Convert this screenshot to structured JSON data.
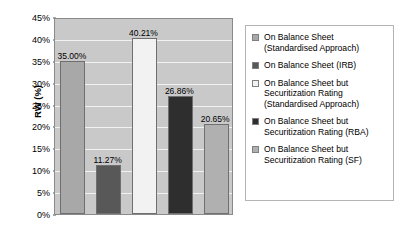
{
  "chart_data": {
    "type": "bar",
    "title": "",
    "xlabel": "",
    "ylabel": "RW (%)",
    "ylim": [
      0,
      45
    ],
    "ytick_labels": [
      "45%",
      "40%",
      "35%",
      "30%",
      "25%",
      "20%",
      "15%",
      "10%",
      "5%",
      "0%"
    ],
    "ytick_values": [
      45,
      40,
      35,
      30,
      25,
      20,
      15,
      10,
      5,
      0
    ],
    "grid": true,
    "legend_position": "right",
    "categories": [
      "On Balance Sheet (Standardised Approach)",
      "On Balance Sheet (IRB)",
      "On Balance Sheet but Securitization Rating (Standardised Approach)",
      "On Balance Sheet but Securitization Rating (RBA)",
      "On Balance Sheet but Securitization Rating (SF)"
    ],
    "values": [
      35.0,
      11.27,
      40.21,
      26.86,
      20.65
    ],
    "data_labels": [
      "35.00%",
      "11.27%",
      "40.21%",
      "26.86%",
      "20.65%"
    ],
    "bar_colors": [
      "#a8a8a8",
      "#585858",
      "#f2f2f2",
      "#2e2e2e",
      "#b0b0b0"
    ],
    "plot_background": "#c9c9c9",
    "gridline_color": "#f2f2f2",
    "axis_color": "#8a8a8a"
  },
  "legend": {
    "items": [
      {
        "label": "On Balance Sheet\n(Standardised Approach)",
        "color": "#a8a8a8"
      },
      {
        "label": "On Balance Sheet (IRB)",
        "color": "#585858"
      },
      {
        "label": "On Balance Sheet but\nSecuritization Rating\n(Standardised Approach)",
        "color": "#f2f2f2"
      },
      {
        "label": "On Balance Sheet but\nSecuritization Rating (RBA)",
        "color": "#2e2e2e"
      },
      {
        "label": "On Balance Sheet but\nSecuritization Rating (SF)",
        "color": "#b0b0b0"
      }
    ]
  }
}
